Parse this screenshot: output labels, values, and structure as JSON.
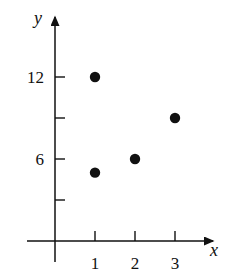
{
  "chart_data": {
    "type": "scatter",
    "title": "",
    "xlabel": "x",
    "ylabel": "y",
    "x_ticks": [
      1,
      2,
      3
    ],
    "x_tick_labels": [
      "1",
      "2",
      "3"
    ],
    "y_ticks": [
      3,
      6,
      9,
      12
    ],
    "y_tick_labels": [
      "",
      "6",
      "",
      "12"
    ],
    "xlim": [
      -0.9,
      3.9
    ],
    "ylim": [
      -2.5,
      16
    ],
    "grid": false,
    "legend": null,
    "points": [
      {
        "x": 1,
        "y": 12
      },
      {
        "x": 3,
        "y": 9
      },
      {
        "x": 2,
        "y": 6
      },
      {
        "x": 1,
        "y": 5
      }
    ],
    "colors": {
      "axis": "#111111",
      "point": "#111111",
      "background": "#ffffff"
    }
  }
}
